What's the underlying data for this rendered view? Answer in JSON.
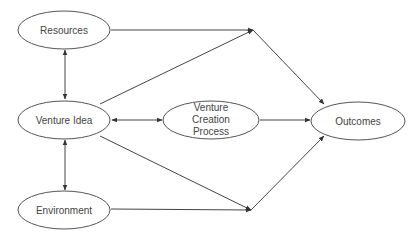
{
  "diagram": {
    "title": "",
    "colors": {
      "line": "#444444",
      "text": "#444444",
      "ellipse_stroke": "#555555",
      "background": "#ffffff"
    },
    "nodes": {
      "resources": {
        "label": "Resources"
      },
      "venture_idea": {
        "label": "Venture Idea"
      },
      "environment": {
        "label": "Environment"
      },
      "venture_creation_process": {
        "lines": [
          "Venture",
          "Creation",
          "Process"
        ]
      },
      "outcomes": {
        "label": "Outcomes"
      }
    },
    "edges": [
      {
        "from": "Resources",
        "to": "Venture Idea",
        "type": "bidirectional"
      },
      {
        "from": "Venture Idea",
        "to": "Environment",
        "type": "bidirectional"
      },
      {
        "from": "Venture Idea",
        "to": "Venture Creation Process",
        "type": "bidirectional"
      },
      {
        "from": "Venture Creation Process",
        "to": "Outcomes",
        "type": "directed"
      },
      {
        "from": "Resources",
        "to": "junction-top",
        "type": "directed"
      },
      {
        "from": "Venture Idea",
        "to": "junction-top",
        "type": "directed"
      },
      {
        "from": "junction-top",
        "to": "Outcomes",
        "type": "directed"
      },
      {
        "from": "Venture Idea",
        "to": "junction-bottom",
        "type": "directed"
      },
      {
        "from": "Environment",
        "to": "junction-bottom",
        "type": "directed"
      },
      {
        "from": "junction-bottom",
        "to": "Outcomes",
        "type": "directed"
      }
    ]
  }
}
